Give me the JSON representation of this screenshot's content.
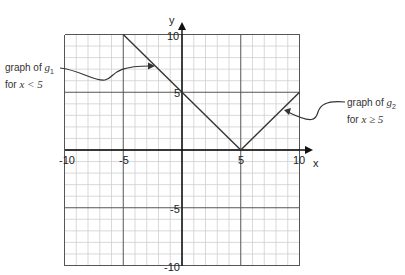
{
  "chart_data": {
    "type": "line",
    "title": "",
    "xlabel": "x",
    "ylabel": "y",
    "xlim": [
      -10,
      10
    ],
    "ylim": [
      -10,
      10
    ],
    "grid": true,
    "grid_minor_step": 1,
    "grid_major_step": 5,
    "x_ticks": [
      -10,
      -5,
      5,
      10
    ],
    "y_ticks": [
      10,
      5,
      -5,
      -10
    ],
    "x_tick_labels": [
      "-10",
      "-5",
      "5",
      "10"
    ],
    "y_tick_labels": [
      "10",
      "5",
      "-5",
      "-10"
    ],
    "series": [
      {
        "name": "g1",
        "domain": "x < 5",
        "points": [
          [
            -5,
            10
          ],
          [
            5,
            0
          ]
        ]
      },
      {
        "name": "g2",
        "domain": "x ≥ 5",
        "points": [
          [
            5,
            0
          ],
          [
            10,
            5
          ]
        ]
      }
    ],
    "annotations": [
      {
        "text_line1": "graph of g1",
        "text_line2": "for x < 5",
        "points_to": [
          -2,
          7
        ]
      },
      {
        "text_line1": "graph of g2",
        "text_line2": "for x ≥ 5",
        "points_to": [
          8.5,
          3.5
        ]
      }
    ]
  },
  "labels": {
    "x_axis": "x",
    "y_axis": "y",
    "g1_prefix": "graph of ",
    "g1_fn": "g",
    "g1_sub": "1",
    "g1_cond_pre": "for ",
    "g1_cond": "x < 5",
    "g2_prefix": "graph of ",
    "g2_fn": "g",
    "g2_sub": "2",
    "g2_cond_pre": "for ",
    "g2_cond": "x ≥ 5",
    "tick_x_m10": "-10",
    "tick_x_m5": "-5",
    "tick_x_5": "5",
    "tick_x_10": "10",
    "tick_y_10": "10",
    "tick_y_5": "5",
    "tick_y_m5": "-5",
    "tick_y_m10": "-10"
  },
  "colors": {
    "grid_minor": "#cfcfcf",
    "grid_major": "#555555",
    "axis": "#111111",
    "line": "#333333"
  }
}
